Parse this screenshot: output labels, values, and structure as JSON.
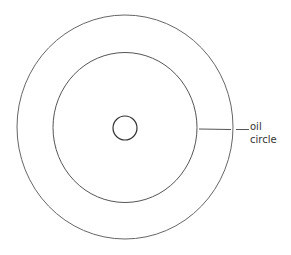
{
  "diagram": {
    "type": "concentric-circles",
    "stroke_color": "#555555",
    "background": "#ffffff",
    "shapes": [
      {
        "name": "outer-circle",
        "cx": 125,
        "cy": 127,
        "rx": 108,
        "ry": 112
      },
      {
        "name": "middle-circle",
        "cx": 125,
        "cy": 127.5,
        "rx": 72,
        "ry": 75
      },
      {
        "name": "inner-circle",
        "cx": 125,
        "cy": 128,
        "rx": 12,
        "ry": 12
      }
    ],
    "annotation": {
      "label_line1": "oil",
      "label_line2": "circle",
      "points_to": "middle-circle"
    }
  }
}
